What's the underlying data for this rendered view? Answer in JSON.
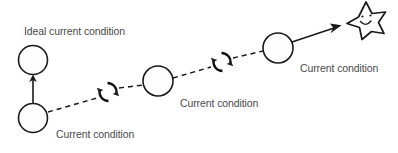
{
  "diagram": {
    "background_color": "#ffffff",
    "stroke_color": "#1a1a1a",
    "label_color": "#4a4a4a",
    "labels": {
      "ideal_current_condition": "Ideal current condition",
      "current_condition_1": "Current condition",
      "current_condition_2": "Current condition",
      "current_condition_3": "Current condition"
    },
    "nodes": [
      {
        "name": "ideal-current-condition-node",
        "cx": 33,
        "cy": 60,
        "r": 14.5
      },
      {
        "name": "current-condition-node-1",
        "cx": 33,
        "cy": 118,
        "r": 14.5
      },
      {
        "name": "current-condition-node-2",
        "cx": 158,
        "cy": 81,
        "r": 15
      },
      {
        "name": "current-condition-node-3",
        "cx": 278,
        "cy": 48,
        "r": 15
      }
    ],
    "cycle_icons": [
      {
        "name": "pdca-cycle-icon-1",
        "cx": 108,
        "cy": 92
      },
      {
        "name": "pdca-cycle-icon-2",
        "cx": 222,
        "cy": 62
      }
    ],
    "goal": {
      "name": "star-goal-icon",
      "cx": 365,
      "cy": 19,
      "expression": "smiling-face"
    },
    "connectors": [
      {
        "name": "vertical-up-arrow",
        "style": "solid",
        "from": [
          33,
          103
        ],
        "to": [
          33,
          76
        ]
      },
      {
        "name": "dashed-progress-line",
        "style": "dashed"
      },
      {
        "name": "goal-arrow",
        "style": "solid",
        "from": [
          292,
          42
        ],
        "to": [
          341,
          26
        ]
      }
    ]
  }
}
